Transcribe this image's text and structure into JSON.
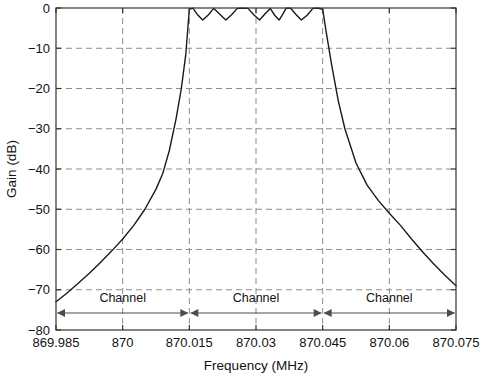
{
  "chart_data": {
    "type": "line",
    "title": "",
    "xlabel": "Frequency (MHz)",
    "ylabel": "Gain (dB)",
    "xlim": [
      869.985,
      870.075
    ],
    "ylim": [
      -80,
      0
    ],
    "grid": true,
    "legend": null,
    "xticks": [
      "869.985",
      "870",
      "870.015",
      "870.03",
      "870.045",
      "870.06",
      "870.075"
    ],
    "xtick_values": [
      869.985,
      870.0,
      870.015,
      870.03,
      870.045,
      870.06,
      870.075
    ],
    "yticks": [
      "0",
      "-10",
      "-20",
      "-30",
      "-40",
      "-50",
      "-60",
      "-70",
      "-80"
    ],
    "ytick_values": [
      0,
      -10,
      -20,
      -30,
      -40,
      -50,
      -60,
      -70,
      -80
    ],
    "series": [
      {
        "name": "Channel filter response",
        "description": "Equiripple bandpass filter magnitude response with 0.3 dB passband ripple from 870.015 to 870.045 MHz",
        "x": [
          869.985,
          869.9875,
          869.99,
          869.9925,
          869.995,
          869.9975,
          870.0,
          870.0025,
          870.005,
          870.0075,
          870.009,
          870.0105,
          870.012,
          870.0132,
          870.0142,
          870.015,
          870.0158,
          870.0168,
          870.018,
          870.0192,
          870.0205,
          870.0218,
          870.0232,
          870.0245,
          870.0258,
          870.027,
          870.0282,
          870.0295,
          870.0308,
          870.032,
          870.0332,
          870.0342,
          870.0352,
          870.036,
          870.0368,
          870.0378,
          870.039,
          870.0402,
          870.0415,
          870.0428,
          870.044,
          870.045,
          870.0458,
          870.047,
          870.0485,
          870.05,
          870.0525,
          870.055,
          870.0575,
          870.06,
          870.0625,
          870.065,
          870.0675,
          870.07,
          870.0725,
          870.075
        ],
        "y": [
          -73.0,
          -70.8,
          -68.4,
          -65.9,
          -63.2,
          -60.4,
          -57.4,
          -54.0,
          -50.0,
          -45.0,
          -41.2,
          -35.4,
          -27.6,
          -20.0,
          -11.5,
          -0.3,
          -0.05,
          -1.6,
          -3.0,
          -1.8,
          -0.1,
          -1.5,
          -3.0,
          -1.7,
          -0.1,
          -0.05,
          -0.1,
          -1.7,
          -3.0,
          -1.5,
          -0.1,
          -1.8,
          -3.0,
          -1.6,
          -0.05,
          -0.05,
          -1.6,
          -3.0,
          -1.8,
          -0.1,
          -0.05,
          -0.3,
          -6.0,
          -14.0,
          -23.0,
          -30.0,
          -38.5,
          -44.0,
          -47.8,
          -51.0,
          -54.0,
          -57.4,
          -60.6,
          -63.6,
          -66.4,
          -69.0
        ]
      }
    ],
    "annotations": [
      {
        "label": "Channel",
        "x_start": 869.985,
        "x_end": 870.015,
        "style": "double-arrow"
      },
      {
        "label": "Channel",
        "x_start": 870.015,
        "x_end": 870.045,
        "style": "double-arrow"
      },
      {
        "label": "Channel",
        "x_start": 870.045,
        "x_end": 870.075,
        "style": "double-arrow"
      }
    ],
    "colors": {
      "curve": "#1a1a1a",
      "grid": "#808080",
      "axis": "#333333",
      "background": "#ffffff",
      "annotation": "#4d4d4d"
    }
  }
}
